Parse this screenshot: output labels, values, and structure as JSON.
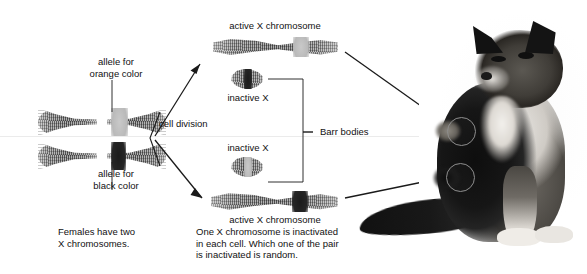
{
  "figure": {
    "background": "#ffffff",
    "ink": "#1a1a1a"
  },
  "labels": {
    "allele_orange": "allele for\norange color",
    "allele_black": "allele for\nblack color",
    "cell_division": "cell division",
    "active_x_top": "active X chromosome",
    "active_x_bottom": "active X chromosome",
    "inactive_x_top": "inactive X",
    "inactive_x_bottom": "inactive X",
    "barr_bodies": "Barr bodies",
    "caption_left": "Females have two\nX chromosomes.",
    "caption_center": "One X chromosome is inactivated\nin each cell. Which one of the pair\nis inactivated is random.",
    "caption_right": "Coats of\ntortoiseshell\ncats have\npatches of\norange and\nblack."
  },
  "chromosomes": [
    {
      "id": "parent-x-orange",
      "form": "metaphase-x",
      "band": "orange",
      "band_meaning": "allele for orange color"
    },
    {
      "id": "parent-x-black",
      "form": "metaphase-x",
      "band": "black",
      "band_meaning": "allele for black color"
    },
    {
      "id": "daughter1-active-x",
      "form": "single-chromatid",
      "band": "orange",
      "state": "active"
    },
    {
      "id": "daughter1-inactive-x",
      "form": "barr-body",
      "band": "black",
      "state": "inactive"
    },
    {
      "id": "daughter2-inactive-x",
      "form": "barr-body",
      "band": "orange",
      "state": "inactive"
    },
    {
      "id": "daughter2-active-x",
      "form": "single-chromatid",
      "band": "black",
      "state": "active"
    }
  ],
  "annotations": {
    "patch_circle_upper": "orange coat patch",
    "patch_circle_lower": "black coat patch",
    "arrow_cell_division_up": "cell division to daughter cell 1",
    "arrow_cell_division_down": "cell division to daughter cell 2",
    "arrow_to_orange_patch": "active orange X produces orange fur patch",
    "arrow_to_black_patch": "active black X produces black fur patch"
  },
  "colors": {
    "chromosome_gray": "#6b6b6b",
    "orange_allele_band": "#bdbdbd",
    "black_allele_band": "#1f1f1f",
    "circle_marker": "#8e8e8e",
    "ink": "#1a1a1a"
  }
}
